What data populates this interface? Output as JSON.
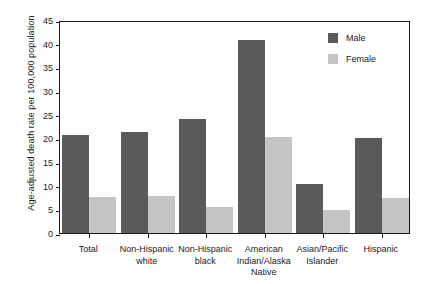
{
  "chart_data": {
    "type": "bar",
    "title": "",
    "xlabel": "",
    "ylabel": "Age-adjusted death rate per 100,000 population",
    "ylim": [
      0,
      45
    ],
    "ytick_labels": [
      "0",
      "5",
      "10",
      "15",
      "20",
      "25",
      "30",
      "35",
      "40",
      "45"
    ],
    "ytick_values": [
      0,
      5,
      10,
      15,
      20,
      25,
      30,
      35,
      40,
      45
    ],
    "grid": false,
    "legend_position": "top-right",
    "categories": [
      "Total",
      "Non-Hispanic\nwhite",
      "Non-Hispanic\nblack",
      "American\nIndian/Alaska\nNative",
      "Asian/Pacific\nIslander",
      "Hispanic"
    ],
    "series": [
      {
        "name": "Male",
        "color": "#5a5a5a",
        "values": [
          20.8,
          21.3,
          24.0,
          40.8,
          10.4,
          20.1
        ]
      },
      {
        "name": "Female",
        "color": "#c4c4c4",
        "values": [
          7.6,
          7.8,
          5.4,
          20.2,
          4.9,
          7.5
        ]
      }
    ]
  },
  "legend": {
    "items": [
      {
        "label": "Male",
        "color": "#5a5a5a"
      },
      {
        "label": "Female",
        "color": "#c4c4c4"
      }
    ]
  },
  "axis": {
    "y_title": "Age-adjusted death rate per 100,000 population"
  }
}
